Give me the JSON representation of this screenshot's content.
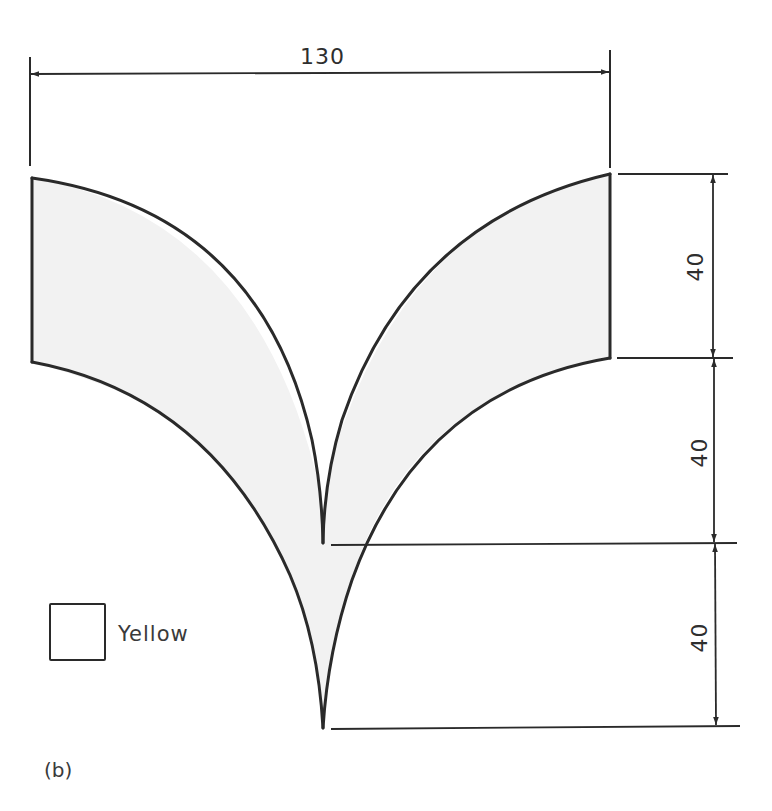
{
  "figure": {
    "caption": "(b)",
    "dimensions": {
      "width_label": "130",
      "height_labels": [
        "40",
        "40",
        "40"
      ]
    },
    "legend": {
      "label": "Yellow",
      "swatch_color": "#ffffff"
    },
    "colors": {
      "stroke": "#2a2a2a",
      "shape_fill": "#f2f2f2",
      "background": "#ffffff"
    }
  }
}
